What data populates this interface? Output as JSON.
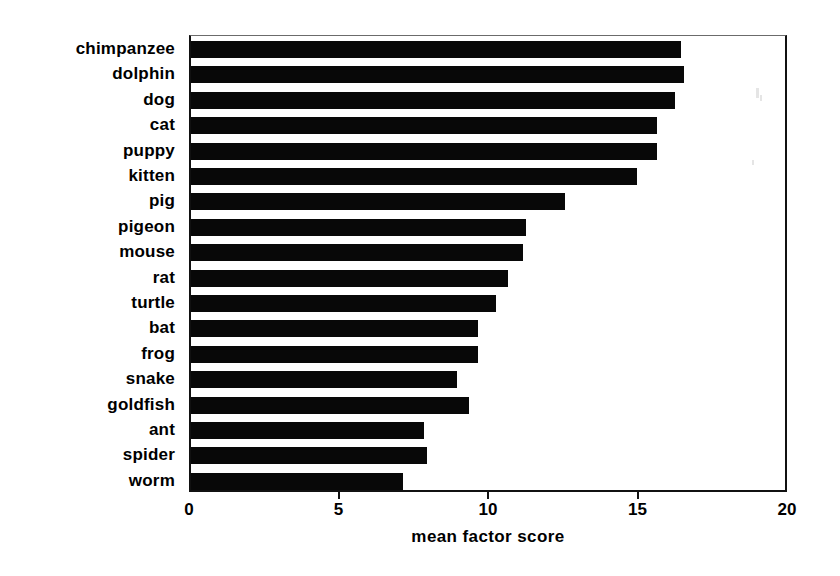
{
  "chart_data": {
    "type": "bar",
    "orientation": "horizontal",
    "title": "",
    "xlabel": "mean factor score",
    "ylabel": "",
    "xlim": [
      0,
      20
    ],
    "xticks": [
      0,
      5,
      10,
      15,
      20
    ],
    "xticklabels": [
      "0",
      "5",
      "10",
      "15",
      "20"
    ],
    "grid": false,
    "legend": null,
    "bar_color": "#080808",
    "categories": [
      "chimpanzee",
      "dolphin",
      "dog",
      "cat",
      "puppy",
      "kitten",
      "pig",
      "pigeon",
      "mouse",
      "rat",
      "turtle",
      "bat",
      "frog",
      "snake",
      "goldfish",
      "ant",
      "spider",
      "worm"
    ],
    "values": [
      16.4,
      16.5,
      16.2,
      15.6,
      15.6,
      14.9,
      12.5,
      11.2,
      11.1,
      10.6,
      10.2,
      9.6,
      9.6,
      8.9,
      9.3,
      7.8,
      7.9,
      7.1
    ]
  }
}
